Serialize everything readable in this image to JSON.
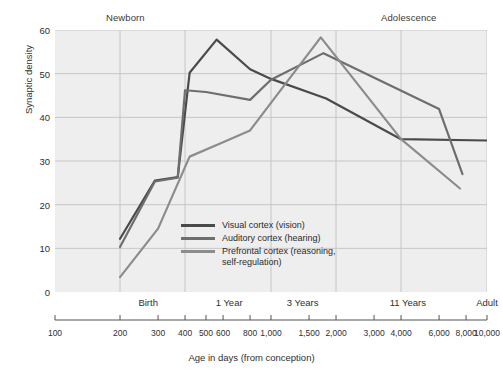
{
  "chart_data": {
    "type": "line",
    "title": "",
    "xlabel": "Age in days (from conception)",
    "ylabel": "Synaptic density",
    "xscale": "log",
    "xlim": [
      100,
      10000
    ],
    "ylim": [
      0,
      60
    ],
    "grid": true,
    "legend_position": "inside-center",
    "y_ticks": [
      0,
      10,
      20,
      30,
      40,
      50,
      60
    ],
    "x_ticks": [
      100,
      200,
      300,
      400,
      500,
      600,
      800,
      1000,
      1500,
      2000,
      3000,
      4000,
      6000,
      8000,
      10000
    ],
    "x_tick_labels": [
      "100",
      "200",
      "300",
      "400",
      "500",
      "600",
      "800",
      "1,000",
      "1,500",
      "2,000",
      "3,000",
      "4,000",
      "6,000",
      "8,000",
      "10,000"
    ],
    "x_gridlines": [
      200,
      400,
      1000,
      2000,
      4000,
      10000
    ],
    "era_ticks": [
      {
        "label": "Birth",
        "x": 270
      },
      {
        "label": "1 Year",
        "x": 640
      },
      {
        "label": "3 Years",
        "x": 1400
      },
      {
        "label": "11 Years",
        "x": 4300
      },
      {
        "label": "Adult",
        "x": 10000
      }
    ],
    "annotations": [
      {
        "label": "Newborn",
        "x": 280,
        "position": "top"
      },
      {
        "label": "Adolescence",
        "x": 5000,
        "position": "top"
      }
    ],
    "series": [
      {
        "name": "Visual cortex (vision)",
        "legend_label": "Visual cortex (vision)",
        "color": "#4a4a4a",
        "points": [
          [
            200,
            12.2
          ],
          [
            290,
            25.5
          ],
          [
            370,
            26.3
          ],
          [
            420,
            50.2
          ],
          [
            560,
            57.8
          ],
          [
            800,
            51.0
          ],
          [
            1000,
            48.8
          ],
          [
            1800,
            44.3
          ],
          [
            4000,
            35.0
          ],
          [
            10000,
            34.7
          ]
        ]
      },
      {
        "name": "Auditory cortex (hearing)",
        "legend_label": "Auditory cortex (hearing)",
        "color": "#6e6e6e",
        "points": [
          [
            200,
            10.3
          ],
          [
            290,
            25.3
          ],
          [
            370,
            26.2
          ],
          [
            400,
            46.2
          ],
          [
            500,
            45.8
          ],
          [
            800,
            44.0
          ],
          [
            1000,
            48.6
          ],
          [
            1750,
            54.7
          ],
          [
            6000,
            41.9
          ],
          [
            7700,
            27.0
          ]
        ]
      },
      {
        "name": "Prefrontal cortex (reasoning, self-regulation)",
        "legend_label_line1": "Prefrontal cortex (reasoning,",
        "legend_label_line2": "self-regulation)",
        "color": "#8c8c8c",
        "points": [
          [
            200,
            3.4
          ],
          [
            300,
            14.5
          ],
          [
            420,
            31.0
          ],
          [
            600,
            34.3
          ],
          [
            800,
            37.0
          ],
          [
            1700,
            58.3
          ],
          [
            4000,
            35.0
          ],
          [
            7500,
            23.7
          ]
        ]
      }
    ]
  },
  "colors": {
    "plot_background": "#eeeeee",
    "gridline": "#c6c6c6",
    "axis_text": "#2f2f2f",
    "page_background": "#ffffff"
  },
  "legend": {
    "items": [
      {
        "label": "Visual cortex (vision)",
        "color": "#4a4a4a"
      },
      {
        "label": "Auditory cortex (hearing)",
        "color": "#6e6e6e"
      },
      {
        "label": "Prefrontal cortex (reasoning,",
        "label2": "self-regulation)",
        "color": "#8c8c8c"
      }
    ]
  }
}
